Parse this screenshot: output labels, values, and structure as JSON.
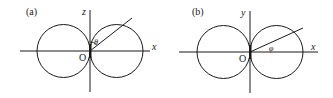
{
  "panels": [
    {
      "id": "a",
      "label": "(a)",
      "vertical_axis_label": "z",
      "horizontal_axis_label": "x",
      "origin_label": "O",
      "angle_label": "θ",
      "description": "Two tangent circles (dumbbell/p-orbital cross-section) in xz-plane with polar angle θ measured from z-axis"
    },
    {
      "id": "b",
      "label": "(b)",
      "vertical_axis_label": "y",
      "horizontal_axis_label": "x",
      "origin_label": "O",
      "angle_label": "φ",
      "description": "Two tangent circles in xy-plane with azimuthal angle φ measured from x-axis"
    }
  ],
  "colors": {
    "stroke": "#1a1a1a",
    "background": "#ffffff"
  }
}
